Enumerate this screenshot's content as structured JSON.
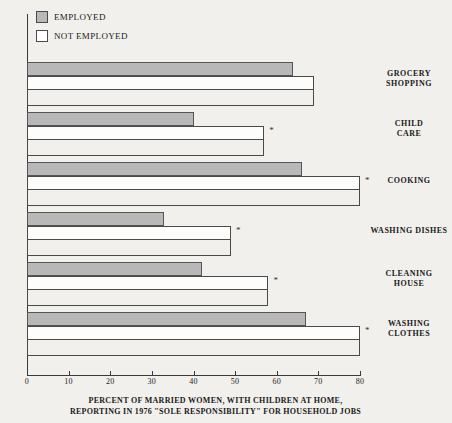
{
  "chart_data": {
    "type": "bar",
    "orientation": "horizontal",
    "title": "",
    "subtitle": "",
    "caption_line_1": "Percent of married women, with children at home,",
    "caption_line_2": "reporting in 1976 \"sole responsibility\" for household jobs",
    "xlabel": "",
    "ylabel": "",
    "xlim": [
      0,
      80
    ],
    "grid": false,
    "legend_position": "top-left",
    "categories": [
      "Grocery Shopping",
      "Child Care",
      "Cooking",
      "Washing Dishes",
      "Cleaning House",
      "Washing Clothes"
    ],
    "series": [
      {
        "name": "Employed",
        "color": "#b8b8b8",
        "values": [
          64,
          40,
          66,
          33,
          42,
          67
        ]
      },
      {
        "name": "Not Employed",
        "color": "#ffffff",
        "values": [
          69,
          57,
          80,
          49,
          58,
          80
        ]
      }
    ],
    "tick_labels": [
      "0",
      "10",
      "20",
      "30",
      "40",
      "50",
      "60",
      "70",
      "80"
    ],
    "tick_values": [
      0,
      10,
      20,
      30,
      40,
      50,
      60,
      70,
      80
    ],
    "annotations": [
      {
        "category": "Child Care",
        "marker": "*"
      },
      {
        "category": "Cooking",
        "marker": "*"
      },
      {
        "category": "Washing Dishes",
        "marker": "*"
      },
      {
        "category": "Cleaning House",
        "marker": "*"
      },
      {
        "category": "Washing Clothes",
        "marker": "*"
      }
    ]
  },
  "legend": {
    "items": [
      {
        "label": "Employed",
        "swatch": "employed"
      },
      {
        "label": "Not Employed",
        "swatch": "notemployed"
      }
    ]
  },
  "category_labels": [
    {
      "line1": "Grocery",
      "line2": "Shopping"
    },
    {
      "line1": "Child",
      "line2": "Care"
    },
    {
      "line1": "Cooking",
      "line2": ""
    },
    {
      "line1": "Washing Dishes",
      "line2": ""
    },
    {
      "line1": "Cleaning",
      "line2": "House"
    },
    {
      "line1": "Washing",
      "line2": "Clothes"
    }
  ]
}
